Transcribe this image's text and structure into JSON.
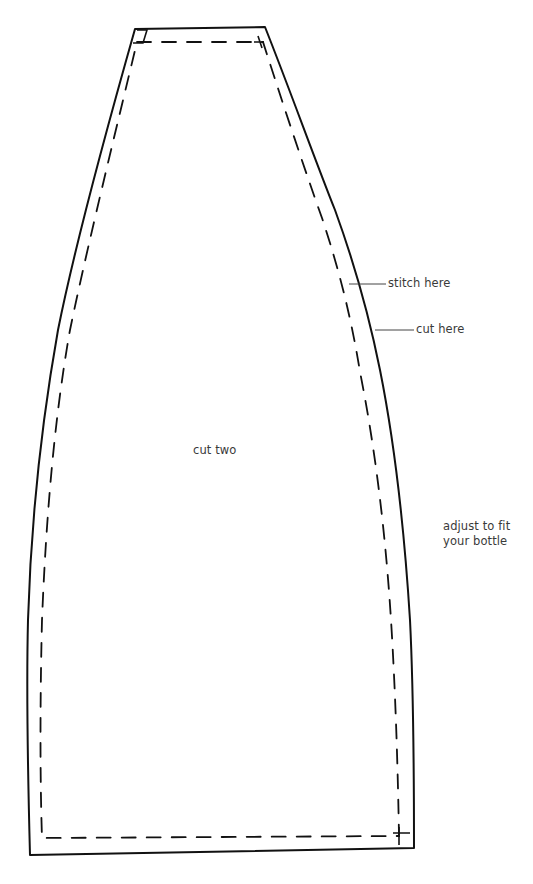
{
  "pattern": {
    "name": "bottle cover pattern piece",
    "labels": {
      "stitch_line": "stitch here",
      "cut_line": "cut here",
      "quantity": "cut two",
      "adjust_line1": "adjust to fit",
      "adjust_line2": "your bottle"
    },
    "line_color": "#111111",
    "text_color": "#3a3a3a"
  }
}
